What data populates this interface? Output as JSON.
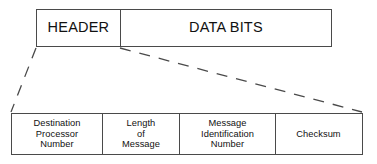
{
  "diagram": {
    "background_color": "#ffffff",
    "line_color": "#4a4a4a",
    "text_color": "#111111"
  },
  "packet": {
    "fields": [
      {
        "id": "header",
        "label": "HEADER"
      },
      {
        "id": "data_bits",
        "label": "DATA BITS"
      }
    ]
  },
  "header_detail": {
    "fields": [
      {
        "id": "destination_processor_number",
        "label": "Destination\nProcessor\nNumber"
      },
      {
        "id": "length_of_message",
        "label": "Length\nof\nMessage"
      },
      {
        "id": "message_identification_number",
        "label": "Message\nIdentification\nNumber"
      },
      {
        "id": "checksum",
        "label": "Checksum"
      }
    ]
  },
  "connectors": {
    "style": "dashed",
    "color": "#4a4a4a",
    "left": {
      "x1": 36,
      "y1": 48,
      "x2": 11,
      "y2": 112
    },
    "right": {
      "x1": 120,
      "y1": 48,
      "x2": 362,
      "y2": 112
    }
  }
}
